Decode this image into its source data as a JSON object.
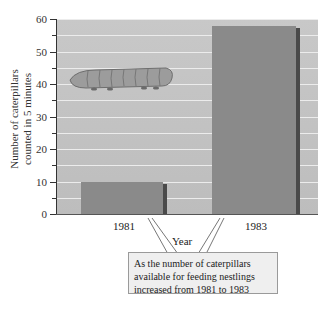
{
  "chart_data": {
    "type": "bar",
    "title": "",
    "xlabel": "Year",
    "ylabel": "Number of caterpillars counted in 5 minutes",
    "ylabel_lines": [
      "Number of caterpillars",
      "counted in 5 minutes"
    ],
    "categories": [
      "1981",
      "1983"
    ],
    "values": [
      10,
      58
    ],
    "ylim": [
      0,
      60
    ],
    "yticks": [
      0,
      10,
      20,
      30,
      40,
      50,
      60
    ],
    "minor_ticks_step": 5,
    "grid": true,
    "legend": null,
    "annotation": {
      "text_lines": [
        "As the number of caterpillars",
        "available for feeding nestlings",
        "increased from 1981 to 1983"
      ],
      "points_to": [
        "1981",
        "1983"
      ]
    },
    "illustration": "caterpillar"
  },
  "colors": {
    "plot_bg": "#c4c4c4",
    "bar": "#8a8a8a",
    "bar_side": "#4a4a4a",
    "gridline": "#ececec",
    "callout_bg": "#efefef"
  }
}
